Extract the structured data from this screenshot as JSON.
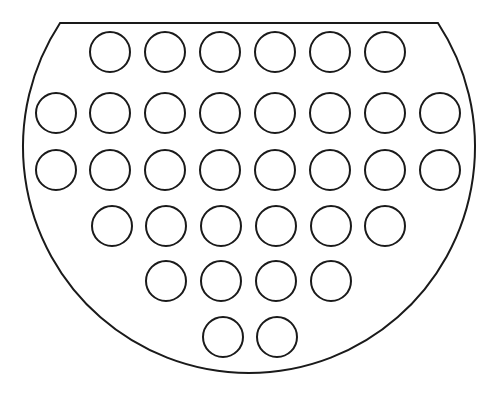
{
  "diagram": {
    "colors": {
      "stroke": "#1a1a1a",
      "background": "#ffffff"
    },
    "outline": {
      "shape": "circle-segment",
      "center": [
        249,
        147
      ],
      "radius": 226,
      "chord_y": 23,
      "stroke_width": 2
    },
    "holes": {
      "radius": 20,
      "stroke_width": 2,
      "rows": [
        {
          "y": 52,
          "x": [
            110,
            165,
            220,
            275,
            330,
            385
          ]
        },
        {
          "y": 113,
          "x": [
            56,
            110,
            165,
            220,
            275,
            330,
            385,
            440
          ]
        },
        {
          "y": 170,
          "x": [
            56,
            110,
            165,
            220,
            275,
            330,
            385,
            440
          ]
        },
        {
          "y": 226,
          "x": [
            112,
            166,
            221,
            276,
            331,
            385
          ]
        },
        {
          "y": 281,
          "x": [
            166,
            221,
            276,
            331
          ]
        },
        {
          "y": 337,
          "x": [
            223,
            277
          ]
        }
      ]
    },
    "hole_count": 34
  }
}
